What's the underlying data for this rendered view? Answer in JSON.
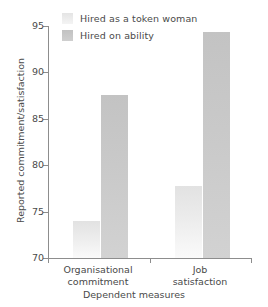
{
  "chart_data": {
    "type": "bar",
    "title": "",
    "subtitle": "",
    "xlabel": "Dependent measures",
    "ylabel": "Reported commitment/satisfaction",
    "categories": [
      "Organisational commitment",
      "Job satisfaction"
    ],
    "category_lines": [
      [
        "Organisational",
        "commitment"
      ],
      [
        "Job",
        "satisfaction"
      ]
    ],
    "series": [
      {
        "name": "Hired as a token woman",
        "values": [
          74.0,
          77.8
        ],
        "color": "#ececec"
      },
      {
        "name": "Hired on ability",
        "values": [
          87.6,
          94.4
        ],
        "color": "#c9c9c9"
      }
    ],
    "ylim": [
      70,
      95
    ],
    "yticks": [
      70,
      75,
      80,
      85,
      90,
      95
    ],
    "ytick_labels": [
      "70",
      "75",
      "80",
      "85",
      "90",
      "95"
    ],
    "grid": false,
    "legend_position": "top-left"
  },
  "legend": {
    "items": [
      {
        "label": "Hired as a token woman",
        "swatch": "light"
      },
      {
        "label": "Hired on ability",
        "swatch": "dark"
      }
    ]
  },
  "axes": {
    "y_axis_title": "Reported commitment/satisfaction",
    "x_axis_title": "Dependent measures"
  },
  "colors": {
    "series_light": "#ececec",
    "series_dark": "#c9c9c9",
    "axis": "#8d8d8d",
    "text": "#4a4a4a",
    "background": "#ffffff"
  }
}
